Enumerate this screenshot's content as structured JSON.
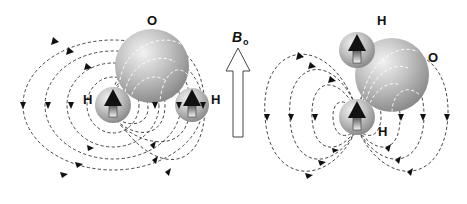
{
  "figure": {
    "field_label": {
      "main": "B",
      "subscript": "o"
    },
    "molecules": [
      {
        "name": "left-water-molecule",
        "orientation": "hydrogens horizontal, perpendicular to field",
        "atoms": [
          {
            "label": "O"
          },
          {
            "label": "H"
          },
          {
            "label": "H"
          }
        ]
      },
      {
        "name": "right-water-molecule",
        "orientation": "hydrogens vertical, parallel to field",
        "atoms": [
          {
            "label": "H"
          },
          {
            "label": "O"
          },
          {
            "label": "H"
          }
        ]
      }
    ],
    "colors": {
      "atom_fill": "#b8b8b8",
      "atom_highlight": "#eeeeee",
      "atom_shadow": "#7a7a7a",
      "field_line": "#333333",
      "spin_arrow": "#111111",
      "background": "#ffffff"
    }
  }
}
